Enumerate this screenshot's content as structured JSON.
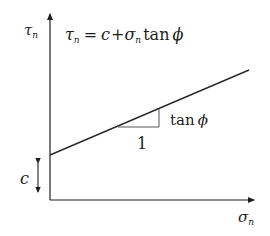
{
  "diagram": {
    "y_axis": {
      "symbol": "τ",
      "subscript": "n"
    },
    "x_axis": {
      "symbol": "σ",
      "subscript": "n"
    },
    "equation": {
      "lhs_symbol": "τ",
      "lhs_sub": "n",
      "equals": "=",
      "c": "c",
      "plus": "+",
      "sigma": "σ",
      "sigma_sub": "n",
      "tan": "tan",
      "phi": "ϕ"
    },
    "slope_label": {
      "tan": "tan",
      "phi": "ϕ"
    },
    "run_label": "1",
    "intercept_label": "c",
    "colors": {
      "axis": "#1e1e1e",
      "line": "#2a2a2a",
      "triangle": "#555555"
    }
  }
}
